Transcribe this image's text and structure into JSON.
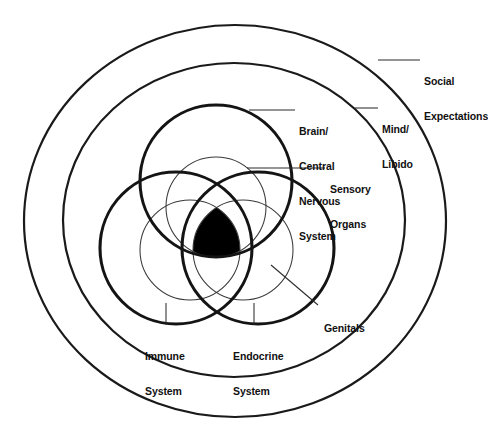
{
  "diagram": {
    "title_visible": false,
    "background_color": "#ffffff",
    "line_color": "#111111",
    "fill_color": "#000000",
    "labels": [
      {
        "id": "social-expectations",
        "lines": [
          "Social",
          "Expectations"
        ],
        "target": "outer-ring"
      },
      {
        "id": "mind-libido",
        "lines": [
          "Mind/",
          "Libido"
        ],
        "target": "middle-ring"
      },
      {
        "id": "brain-central-nervous-system",
        "lines": [
          "Brain/",
          "Central",
          "Nervous",
          "System"
        ],
        "target": "top-thick-circle"
      },
      {
        "id": "sensory-organs",
        "lines": [
          "Sensory",
          "Organs"
        ],
        "target": "upper-thin-circle"
      },
      {
        "id": "genitals",
        "lines": [
          "Genitals"
        ],
        "target": "lower-right-thin-circle"
      },
      {
        "id": "immune-system",
        "lines": [
          "Immune",
          "System"
        ],
        "target": "lower-left-thick-circle"
      },
      {
        "id": "endocrine-system",
        "lines": [
          "Endocrine",
          "System"
        ],
        "target": "lower-right-thick-circle"
      }
    ],
    "shapes": {
      "rings": [
        {
          "id": "outer-ring",
          "name": "social-expectations-ring",
          "cx": 235,
          "cy": 221,
          "rx": 211,
          "ry": 196,
          "weight": "medium"
        },
        {
          "id": "middle-ring",
          "name": "mind-libido-ring",
          "cx": 234,
          "cy": 220,
          "rx": 171,
          "ry": 157,
          "weight": "medium"
        }
      ],
      "thick_circles": [
        {
          "id": "top-thick-circle",
          "name": "brain-central-nervous-system-circle",
          "cx": 216,
          "cy": 181,
          "r": 76
        },
        {
          "id": "lower-left-thick-circle",
          "name": "immune-system-circle",
          "cx": 176,
          "cy": 248,
          "r": 76
        },
        {
          "id": "lower-right-thick-circle",
          "name": "endocrine-system-circle",
          "cx": 258,
          "cy": 248,
          "r": 76
        }
      ],
      "thin_circles": [
        {
          "id": "upper-thin-circle",
          "name": "sensory-organs-circle",
          "cx": 216,
          "cy": 207,
          "r": 50
        },
        {
          "id": "lower-left-thin-circle",
          "name": "mind-libido-inner-circle",
          "cx": 190,
          "cy": 250,
          "r": 50
        },
        {
          "id": "lower-right-thin-circle",
          "name": "genitals-circle",
          "cx": 243,
          "cy": 250,
          "r": 50
        }
      ],
      "core": {
        "id": "core-intersection",
        "name": "triple-intersection-region",
        "fill": "#000000",
        "description": "black triple-overlap region at center"
      }
    }
  }
}
